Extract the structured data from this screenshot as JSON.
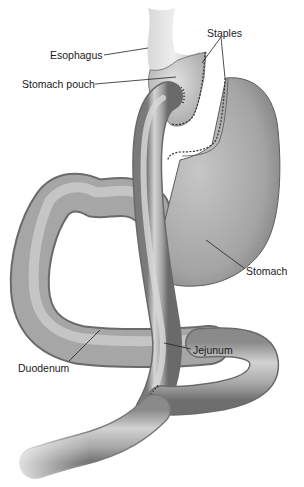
{
  "diagram": {
    "type": "anatomical-illustration",
    "labels": [
      {
        "id": "esophagus",
        "text": "Esophagus",
        "x": 50,
        "y": 49
      },
      {
        "id": "stomach-pouch",
        "text": "Stomach pouch",
        "x": 22,
        "y": 78
      },
      {
        "id": "staples",
        "text": "Staples",
        "x": 207,
        "y": 27
      },
      {
        "id": "stomach",
        "text": "Stomach",
        "x": 246,
        "y": 265
      },
      {
        "id": "duodenum",
        "text": "Duodenum",
        "x": 18,
        "y": 362
      },
      {
        "id": "jejunum",
        "text": "Jejunum",
        "x": 193,
        "y": 344
      }
    ],
    "colors": {
      "organ_fill": "#a9a9a9",
      "organ_highlight": "#d6d6d6",
      "organ_shadow": "#7a7a7a",
      "outline": "#5a5a5a",
      "leader_line": "#222222",
      "staple": "#333333"
    }
  }
}
